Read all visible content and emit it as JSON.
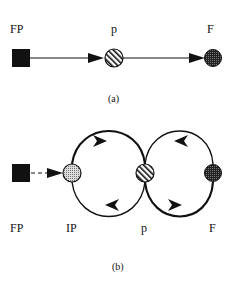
{
  "panel_a": {
    "caption": "(a)",
    "nodes": [
      {
        "id": "FP",
        "label": "FP",
        "shape": "filled-square",
        "color": "#111111"
      },
      {
        "id": "p",
        "label": "p",
        "shape": "hatched-circle",
        "color": "#ffffff"
      },
      {
        "id": "F",
        "label": "F",
        "shape": "dark-stippled-circle",
        "color": "#333333"
      }
    ],
    "edges": [
      {
        "from": "FP",
        "to": "p",
        "style": "solid",
        "arrow": "forward"
      },
      {
        "from": "p",
        "to": "F",
        "style": "solid",
        "arrow": "forward"
      }
    ]
  },
  "panel_b": {
    "caption": "(b)",
    "nodes": [
      {
        "id": "FP",
        "label": "FP",
        "shape": "filled-square",
        "color": "#111111"
      },
      {
        "id": "IP",
        "label": "IP",
        "shape": "light-stippled-circle",
        "color": "#bbbbbb"
      },
      {
        "id": "p",
        "label": "p",
        "shape": "hatched-circle",
        "color": "#ffffff"
      },
      {
        "id": "F",
        "label": "F",
        "shape": "dark-stippled-circle",
        "color": "#333333"
      }
    ],
    "edges": [
      {
        "from": "FP",
        "to": "IP",
        "style": "dashed",
        "arrow": "forward"
      },
      {
        "from": "IP",
        "to": "p",
        "style": "solid-arc-top",
        "arrow": "forward"
      },
      {
        "from": "p",
        "to": "IP",
        "style": "solid-arc-bottom",
        "arrow": "forward"
      },
      {
        "from": "F",
        "to": "p",
        "style": "solid-arc-top",
        "arrow": "forward"
      },
      {
        "from": "p",
        "to": "F",
        "style": "solid-arc-bottom",
        "arrow": "forward"
      }
    ]
  }
}
